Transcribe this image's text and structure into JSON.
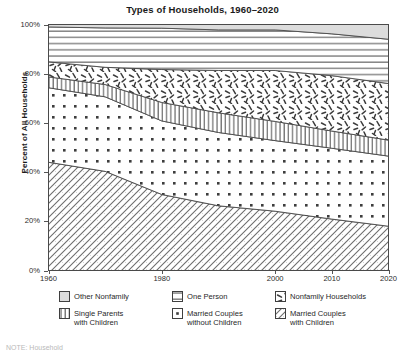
{
  "chart_data": {
    "type": "area",
    "title": "Types of  Households, 1960–2020",
    "xlabel": "",
    "ylabel": "Percent of All Households",
    "ylim": [
      0,
      100
    ],
    "xlim": [
      1960,
      2020
    ],
    "grid": false,
    "stacked": true,
    "legend_position": "bottom",
    "x": [
      1960,
      1970,
      1980,
      1990,
      2000,
      2010,
      2020
    ],
    "xticks": [
      1960,
      1980,
      2000,
      2010,
      2020
    ],
    "xticklabels": [
      "1960",
      "1980",
      "2000",
      "2010",
      "2020"
    ],
    "yticks": [
      0,
      20,
      40,
      60,
      80,
      100
    ],
    "yticklabels": [
      "0%",
      "20%",
      "40%",
      "60%",
      "80%",
      "100%"
    ],
    "series": [
      {
        "name": "Married Couples with Children",
        "pattern": "diagonal-hatch",
        "values": [
          44.0,
          40.3,
          30.9,
          26.3,
          24.1,
          20.9,
          18.0
        ]
      },
      {
        "name": "Married Couples without Children",
        "pattern": "dots",
        "values": [
          30.3,
          30.3,
          29.9,
          29.8,
          28.7,
          28.8,
          28.5
        ]
      },
      {
        "name": "Single Parents with Children",
        "pattern": "vertical-lines",
        "values": [
          4.4,
          5.0,
          7.5,
          8.0,
          7.8,
          7.0,
          6.5
        ]
      },
      {
        "name": "Nonfamily Households",
        "pattern": "squiggle",
        "values": [
          6.1,
          7.0,
          13.4,
          17.2,
          20.7,
          22.5,
          23.0
        ]
      },
      {
        "name": "One Person",
        "pattern": "horizontal-lines",
        "values": [
          14.2,
          16.0,
          16.8,
          16.5,
          16.5,
          17.0,
          18.0
        ]
      },
      {
        "name": "Other Nonfamily",
        "pattern": "solid-gray",
        "values": [
          1.0,
          1.4,
          1.5,
          2.2,
          2.2,
          3.8,
          6.0
        ]
      }
    ],
    "cumulative_tops": {
      "married_with_children": [
        44.0,
        40.3,
        30.9,
        26.3,
        24.1,
        20.9,
        18.0
      ],
      "married_without_children": [
        74.3,
        70.6,
        60.8,
        56.1,
        52.8,
        49.7,
        46.5
      ],
      "single_parents": [
        78.7,
        75.6,
        68.3,
        64.1,
        60.6,
        56.7,
        53.0
      ],
      "nonfamily_households": [
        84.8,
        82.6,
        81.7,
        81.3,
        81.3,
        79.2,
        76.0
      ],
      "one_person": [
        99.0,
        98.6,
        98.5,
        97.8,
        97.8,
        96.2,
        94.0
      ],
      "other_nonfamily": [
        100,
        100,
        100,
        100,
        100,
        100,
        100
      ]
    }
  },
  "legend": {
    "items": [
      {
        "label": "Other Nonfamily",
        "icon": "solid-gray-swatch-icon"
      },
      {
        "label": "One Person",
        "icon": "horizontal-lines-swatch-icon"
      },
      {
        "label": "Nonfamily Households",
        "icon": "squiggle-swatch-icon"
      },
      {
        "label": "Single Parents\nwith Children",
        "icon": "vertical-lines-swatch-icon"
      },
      {
        "label": "Married Couples\nwithout Children",
        "icon": "dots-swatch-icon"
      },
      {
        "label": "Married Couples\nwith Children",
        "icon": "diagonal-hatch-swatch-icon"
      }
    ]
  },
  "footer": {
    "note": "NOTE: Household"
  },
  "colors": {
    "ink": "#1a1a1a",
    "axis": "#4a4a4a",
    "solid_gray": "#d9d9d9",
    "band_fill": "#ffffff"
  }
}
